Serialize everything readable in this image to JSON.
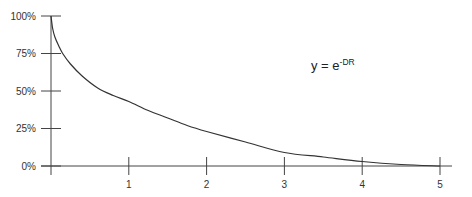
{
  "chart_data": {
    "type": "line",
    "title": "",
    "annotation": {
      "base": "y = e",
      "superscript": "-DR"
    },
    "xlabel": "",
    "ylabel": "",
    "xlim": [
      0,
      5
    ],
    "ylim": [
      0,
      100
    ],
    "x_ticks": [
      "1",
      "2",
      "3",
      "4",
      "5"
    ],
    "y_ticks": [
      "0%",
      "25%",
      "50%",
      "75%",
      "100%"
    ],
    "grid": false,
    "legend": null,
    "series": [
      {
        "name": "y = e^-DR",
        "x": [
          0,
          0.02,
          0.05,
          0.1,
          0.15,
          0.25,
          0.4,
          0.6,
          0.8,
          1.0,
          1.25,
          1.5,
          1.75,
          2.0,
          2.5,
          3.0,
          3.5,
          4.0,
          4.5,
          5.0
        ],
        "values": [
          100,
          92,
          86,
          80,
          75,
          68,
          60,
          52,
          47,
          43,
          37,
          32,
          27,
          23,
          16,
          9,
          6,
          3,
          1,
          0
        ]
      }
    ],
    "colors": {
      "line": "#333333",
      "axis": "#444444"
    }
  }
}
